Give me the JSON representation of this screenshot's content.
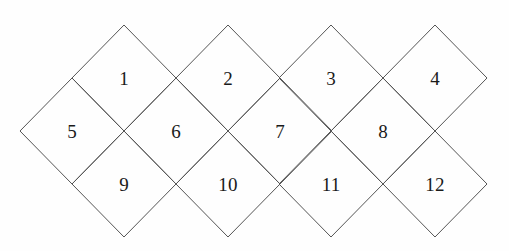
{
  "figure": {
    "type": "diamond-tiling",
    "canvas": {
      "width": 509,
      "height": 251
    },
    "stroke_color": "#555555",
    "fill_color": "#ffffff",
    "background_color": "#fefefe",
    "label_color": "#1a1a1a",
    "diamond": {
      "half_width": 52,
      "half_height": 53
    },
    "rows": [
      {
        "name": "top-row",
        "center_y": 78,
        "centers_x": [
          124,
          228,
          331,
          435
        ]
      },
      {
        "name": "middle-row",
        "center_y": 131,
        "centers_x": [
          72,
          176,
          280,
          383
        ]
      },
      {
        "name": "bottom-row",
        "center_y": 184,
        "centers_x": [
          124,
          228,
          331,
          435
        ]
      }
    ],
    "cells": [
      {
        "label": "1",
        "cx": 124,
        "cy": 78,
        "row": 0,
        "col": 0
      },
      {
        "label": "2",
        "cx": 228,
        "cy": 78,
        "row": 0,
        "col": 1
      },
      {
        "label": "3",
        "cx": 331,
        "cy": 78,
        "row": 0,
        "col": 2
      },
      {
        "label": "4",
        "cx": 435,
        "cy": 78,
        "row": 0,
        "col": 3
      },
      {
        "label": "5",
        "cx": 72,
        "cy": 131,
        "row": 1,
        "col": 0
      },
      {
        "label": "6",
        "cx": 176,
        "cy": 131,
        "row": 1,
        "col": 1
      },
      {
        "label": "7",
        "cx": 280,
        "cy": 131,
        "row": 1,
        "col": 2
      },
      {
        "label": "8",
        "cx": 383,
        "cy": 131,
        "row": 1,
        "col": 3
      },
      {
        "label": "9",
        "cx": 124,
        "cy": 184,
        "row": 2,
        "col": 0
      },
      {
        "label": "10",
        "cx": 228,
        "cy": 184,
        "row": 2,
        "col": 1
      },
      {
        "label": "11",
        "cx": 331,
        "cy": 184,
        "row": 2,
        "col": 2
      },
      {
        "label": "12",
        "cx": 435,
        "cy": 184,
        "row": 2,
        "col": 3
      }
    ]
  }
}
